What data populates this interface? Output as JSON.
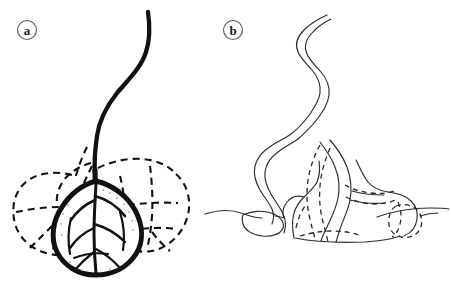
{
  "figure": {
    "background_color": "#ffffff",
    "ink_color": "#111111",
    "secondary_ink_color": "#2b2b2b",
    "label_ring_color": "#5a5a5a",
    "width": 451,
    "height": 284,
    "style": "scanned black-and-white line drawing, two labelled panels"
  },
  "panels": [
    {
      "id": "panel-a",
      "label": "a",
      "label_position": {
        "x": 27,
        "y": 30
      },
      "description": "Bulbous organ with thick dark outline and internal branching vein network, enclosed by dashed lobed envelopes, with a thick solid S-curved stalk rising from the apex",
      "elements": {
        "stalk": "thick solid S-curve descending from top of panel to the bulb apex",
        "bulb": "thick-outlined teardrop body with interior polygonal vein cells",
        "veins": "solid branching lines subdividing the bulb interior",
        "lobes": "dashed outlines of surrounding lobes fanning left and right",
        "shading": "stippled speckle shading along the inner bulb wall"
      }
    },
    {
      "id": "panel-b",
      "label": "b",
      "label_position": {
        "x": 233,
        "y": 30
      },
      "description": "Thin double-line meandering tube descending from top into a mound sitting on a ground line, with dashed internal contours and a small dashed rounded body at right",
      "elements": {
        "tube": "thin double-outline sinuous tube, meandering S-shaped course",
        "mound": "solid outline mound resting on the ground line",
        "ground_line": "thin horizontal undulating surface line spanning the panel",
        "left_lobe": "small closed loop on the ground line at the left",
        "dashed_contours": "dashed interior boundaries inside the mound",
        "right_blob": "small dashed rounded body at the right of the mound"
      }
    }
  ],
  "labels": {
    "panel_a": "a",
    "panel_b": "b"
  }
}
